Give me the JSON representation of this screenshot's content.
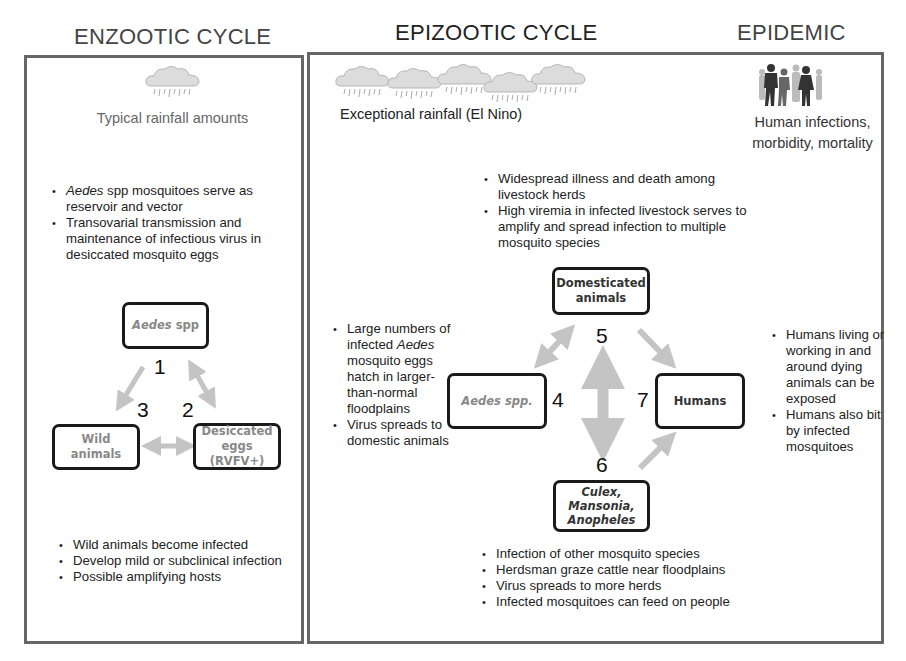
{
  "headings": {
    "enzootic": "ENZOOTIC CYCLE",
    "epizootic": "EPIZOOTIC CYCLE",
    "epidemic": "EPIDEMIC"
  },
  "enzootic": {
    "icon": "rain-cloud-icon",
    "caption": "Typical rainfall amounts",
    "top_bullets": [
      {
        "italic": "Aedes",
        "text": " spp mosquitoes serve as reservoir and vector"
      },
      {
        "italic": "",
        "text": "Transovarial transmission and maintenance of infectious virus in desiccated mosquito eggs"
      }
    ],
    "nodes": {
      "aedes": {
        "italic": "Aedes",
        "text": " spp"
      },
      "wild": "Wild animals",
      "eggs_line1": "Desiccated",
      "eggs_line2": "eggs (RVFV+)"
    },
    "numbers": [
      "1",
      "2",
      "3"
    ],
    "bottom_bullets": [
      "Wild animals become infected",
      "Develop mild or subclinical infection",
      "Possible amplifying hosts"
    ]
  },
  "epizootic": {
    "icon": "rain-clouds-icon",
    "cloud_count": 5,
    "caption": "Exceptional rainfall (El Nino)",
    "top_bullets": [
      "Widespread illness and death among livestock herds",
      "High viremia in infected livestock serves to amplify and spread infection to multiple mosquito species"
    ],
    "left_bullets": [
      {
        "pre": "Large numbers of infected ",
        "italic": "Aedes",
        "post": " mosquito eggs hatch in larger-than-normal floodplains"
      },
      {
        "pre": "Virus spreads to domestic animals",
        "italic": "",
        "post": ""
      }
    ],
    "nodes": {
      "domesticated_line1": "Domesticated",
      "domesticated_line2": "animals",
      "aedes": "Aedes spp.",
      "humans": "Humans",
      "culex_line1": "Culex,",
      "culex_line2": "Mansonia,",
      "culex_line3": "Anopheles"
    },
    "numbers": [
      "4",
      "5",
      "6",
      "7"
    ],
    "bottom_bullets": [
      "Infection of other mosquito species",
      "Herdsman graze cattle near floodplains",
      "Virus spreads to more herds",
      "Infected mosquitoes can feed on people"
    ]
  },
  "epidemic": {
    "icon": "people-silhouette-icon",
    "caption_line1": "Human infections,",
    "caption_line2": "morbidity, mortality",
    "right_bullets": [
      "Humans living or working in and around dying animals can be exposed",
      "Humans also bit by infected mosquitoes"
    ]
  },
  "colors": {
    "panel_border": "#666666",
    "node_border": "#1a1a1a",
    "arrow_fill": "#c4c4c4",
    "heading_text": "#444444"
  }
}
